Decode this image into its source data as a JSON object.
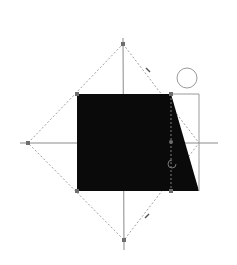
{
  "colors": {
    "background": "#ffffff",
    "shape_fill": "#0a0a0a",
    "guide_line": "#8a8a8a",
    "dashed_line": "#9a9a9a",
    "handle": "#6e6e6e",
    "bbox": "#9a9a9a"
  },
  "shape": {
    "name": "trapezoid",
    "points": "77,94 171,94 199,191 77,191"
  },
  "icons": {
    "rotate_handle": "circle",
    "center_marker": "refresh-icon"
  }
}
